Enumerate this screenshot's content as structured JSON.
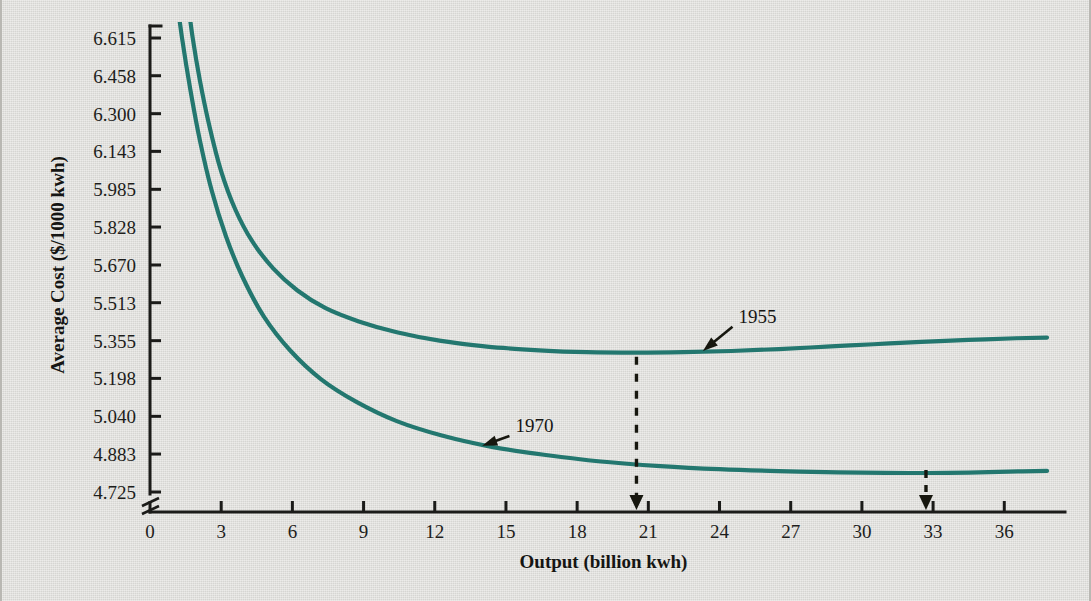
{
  "chart_data": {
    "type": "line",
    "title": "",
    "xlabel": "Output (billion kwh)",
    "ylabel": "Average Cost ($/1000 kwh)",
    "xlim": [
      0,
      37.8
    ],
    "ylim": [
      4.725,
      6.615
    ],
    "grid": false,
    "legend_position": "inline-annotations",
    "y_axis_break": true,
    "xticks": [
      0,
      3,
      6,
      9,
      12,
      15,
      18,
      21,
      24,
      27,
      30,
      33,
      36
    ],
    "xtick_labels": [
      "0",
      "3",
      "6",
      "9",
      "12",
      "15",
      "18",
      "21",
      "24",
      "27",
      "30",
      "33",
      "36"
    ],
    "yticks": [
      4.725,
      4.883,
      5.04,
      5.198,
      5.355,
      5.513,
      5.67,
      5.828,
      5.985,
      6.143,
      6.3,
      6.458,
      6.615
    ],
    "ytick_labels": [
      "4.725",
      "4.883",
      "5.040",
      "5.198",
      "5.355",
      "5.513",
      "5.670",
      "5.828",
      "5.985",
      "6.143",
      "6.300",
      "6.458",
      "6.615"
    ],
    "series": [
      {
        "name": "1955",
        "color": "#23776f",
        "minimum_x": 20.5,
        "minimum_y": 5.305,
        "x": [
          1.55,
          1.8,
          2.1,
          2.5,
          3.0,
          3.6,
          4.3,
          5.2,
          6.2,
          7.4,
          8.8,
          10.4,
          12.2,
          14.2,
          16.4,
          18.4,
          20.5,
          22.5,
          24.5,
          26.5,
          28.5,
          30.5,
          32.5,
          34.5,
          36.5,
          37.8
        ],
        "y": [
          6.8,
          6.615,
          6.44,
          6.25,
          6.06,
          5.9,
          5.77,
          5.655,
          5.565,
          5.49,
          5.435,
          5.39,
          5.355,
          5.33,
          5.315,
          5.307,
          5.305,
          5.307,
          5.312,
          5.32,
          5.33,
          5.34,
          5.35,
          5.358,
          5.365,
          5.368
        ]
      },
      {
        "name": "1970",
        "color": "#23776f",
        "minimum_x": 32.7,
        "minimum_y": 4.805,
        "x": [
          1.1,
          1.35,
          1.7,
          2.1,
          2.6,
          3.2,
          3.9,
          4.8,
          5.9,
          7.2,
          8.7,
          10.4,
          12.3,
          14.4,
          16.6,
          19.0,
          21.5,
          24.0,
          26.5,
          29.0,
          31.0,
          32.7,
          34.5,
          36.2,
          37.8
        ],
        "y": [
          6.8,
          6.615,
          6.4,
          6.19,
          5.98,
          5.79,
          5.62,
          5.455,
          5.315,
          5.195,
          5.1,
          5.02,
          4.96,
          4.913,
          4.88,
          4.852,
          4.833,
          4.82,
          4.812,
          4.807,
          4.805,
          4.804,
          4.806,
          4.81,
          4.813
        ]
      }
    ],
    "annotations": [
      {
        "name": "series-label-1955",
        "text": "1955",
        "x": 24.8,
        "y": 5.43,
        "points_to_x": 23.3,
        "points_to_y": 5.312
      },
      {
        "name": "series-label-1970",
        "text": "1970",
        "x": 15.4,
        "y": 4.975,
        "points_to_x": 14.0,
        "points_to_y": 4.918
      },
      {
        "name": "minimum-marker-1955",
        "type": "dashed-drop-line",
        "x": 20.5,
        "from_y": 5.305,
        "to_y": 4.725
      },
      {
        "name": "minimum-marker-1970",
        "type": "axis-arrow",
        "x": 32.7
      }
    ]
  }
}
